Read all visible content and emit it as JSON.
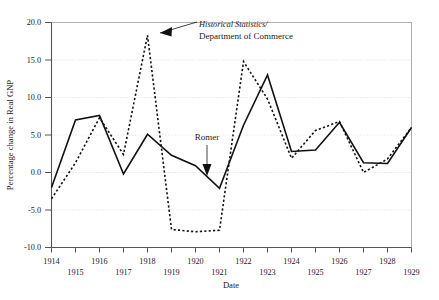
{
  "chart_data": {
    "type": "line",
    "title": "",
    "xlabel": "Date",
    "ylabel": "Percentage change in Real GNP",
    "x": [
      1914,
      1915,
      1916,
      1917,
      1918,
      1919,
      1920,
      1921,
      1922,
      1923,
      1924,
      1925,
      1926,
      1927,
      1928,
      1929
    ],
    "xlim": [
      1914,
      1929
    ],
    "ylim": [
      -10.0,
      20.0
    ],
    "yticks": [
      -10.0,
      -5.0,
      0.0,
      5.0,
      10.0,
      15.0,
      20.0
    ],
    "ytick_labels": [
      "-10.0",
      "-5.0",
      "0.0",
      "5.0",
      "10.0",
      "15.0",
      "20.0"
    ],
    "xtick_labels_top": [
      "1914",
      "1916",
      "1918",
      "1920",
      "1922",
      "1924",
      "1926",
      "1928"
    ],
    "xtick_labels_bottom": [
      "1915",
      "1917",
      "1919",
      "1921",
      "1923",
      "1925",
      "1927",
      "1929"
    ],
    "xtick_labels_all": [
      "1914",
      "1915",
      "1916",
      "1917",
      "1918",
      "1919",
      "1920",
      "1921",
      "1922",
      "1923",
      "1924",
      "1925",
      "1926",
      "1927",
      "1928",
      "1929"
    ],
    "grid": true,
    "legend_position": "inline-annotations",
    "series": [
      {
        "name": "Romer",
        "style": "solid",
        "color": "#111111",
        "values": [
          -2.0,
          7.0,
          7.6,
          -0.2,
          5.1,
          2.3,
          0.9,
          -2.1,
          6.3,
          13.0,
          2.8,
          3.0,
          6.7,
          1.3,
          1.2,
          6.0
        ]
      },
      {
        "name": "Historical Statistics/Department of Commerce",
        "style": "dashed",
        "color": "#111111",
        "values": [
          -3.5,
          1.3,
          7.3,
          2.4,
          18.3,
          -7.6,
          -7.9,
          -7.7,
          14.8,
          9.8,
          1.9,
          5.6,
          6.8,
          0.0,
          1.8,
          6.0
        ]
      }
    ],
    "annotations": [
      {
        "name": "historical-statistics-label",
        "line1": "Historical Statistics/",
        "line2": "Department of Commerce",
        "points_to": {
          "x": 1918,
          "y": 17.2
        },
        "arrow": "left"
      },
      {
        "name": "romer-label",
        "line1": "Romer",
        "points_to": {
          "x": 1920.6,
          "y": 0.4
        },
        "arrow": "down"
      }
    ]
  },
  "axes": {
    "y_axis_title": "Percentage change in Real GNP",
    "x_axis_title": "Date"
  }
}
